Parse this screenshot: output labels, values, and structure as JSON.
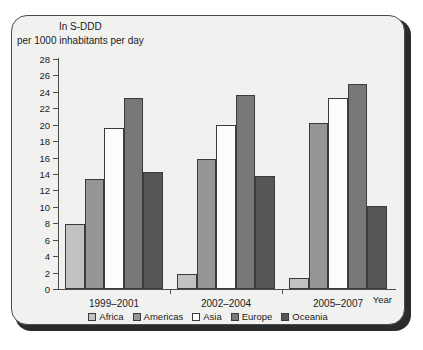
{
  "chart_data": {
    "type": "bar",
    "title": "In S-DDD",
    "subtitle": "per 1000 inhabitants per day",
    "xlabel": "Year",
    "ylabel": "",
    "categories": [
      "1999–2001",
      "2002–2004",
      "2005–2007"
    ],
    "ylim": [
      0,
      28
    ],
    "ytick_step": 2,
    "yticks": [
      "28",
      "26",
      "24",
      "22",
      "20",
      "18",
      "16",
      "14",
      "12",
      "10",
      "8",
      "6",
      "4",
      "2",
      "0"
    ],
    "grid": false,
    "legend_position": "bottom",
    "series": [
      {
        "name": "Africa",
        "color": "#c2c2c2",
        "values": [
          7.9,
          1.8,
          1.3
        ]
      },
      {
        "name": "Americas",
        "color": "#969696",
        "values": [
          13.4,
          15.8,
          20.2
        ]
      },
      {
        "name": "Asia",
        "color": "#fdfdfd",
        "values": [
          19.6,
          20.0,
          23.3
        ]
      },
      {
        "name": "Europe",
        "color": "#787878",
        "values": [
          23.2,
          23.6,
          24.9
        ]
      },
      {
        "name": "Oceania",
        "color": "#565656",
        "values": [
          14.3,
          13.7,
          10.1
        ]
      }
    ]
  },
  "legend": {
    "items": [
      {
        "label": "Africa"
      },
      {
        "label": "Americas"
      },
      {
        "label": "Asia"
      },
      {
        "label": "Europe"
      },
      {
        "label": "Oceania"
      }
    ]
  }
}
